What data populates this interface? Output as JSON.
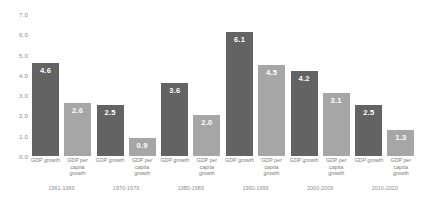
{
  "chart_data": {
    "type": "bar",
    "title": "",
    "subtitle": "",
    "xlabel": "",
    "ylabel": "",
    "ylim": [
      0.0,
      7.0
    ],
    "ytick_step": 1.0,
    "yticks": [
      "0.0",
      "1.0",
      "2.0",
      "3.0",
      "4.0",
      "5.0",
      "6.0",
      "7.0"
    ],
    "grid": false,
    "legend": "none",
    "legend_position": "none",
    "categories": [
      "1961-1969",
      "1970-1979",
      "1980-1989",
      "1990-1999",
      "2000-2009",
      "2010-2020"
    ],
    "series": [
      {
        "name": "GDP growth",
        "color": "#636363",
        "values": [
          4.6,
          2.5,
          3.6,
          6.1,
          4.2,
          2.5
        ],
        "labels": [
          "4.6",
          "2.5",
          "3.6",
          "6.1",
          "4.2",
          "2.5"
        ]
      },
      {
        "name": "GDP per capita growth",
        "color": "#a6a6a6",
        "values": [
          2.6,
          0.9,
          2.0,
          4.5,
          3.1,
          1.3
        ],
        "labels": [
          "2.6",
          "0.9",
          "2.0",
          "4.5",
          "3.1",
          "1.3"
        ]
      }
    ],
    "series_label_lines": [
      [
        "GDP growth"
      ],
      [
        "GDP per",
        "capita",
        "growth"
      ]
    ],
    "colors": {
      "background": "#ffffff",
      "dark_bar": "#636363",
      "light_bar": "#a6a6a6",
      "tick_text": "#8c8c8c",
      "value_text": "#ffffff"
    }
  }
}
